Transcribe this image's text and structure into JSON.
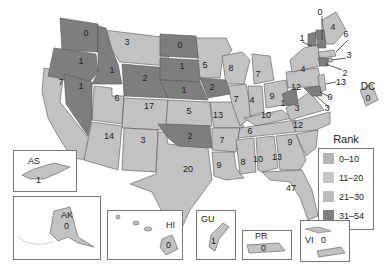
{
  "title": "",
  "legend": {
    "title": "Rank",
    "items": [
      {
        "label": "0–10",
        "color": "#b4b4b4"
      },
      {
        "label": "11–20",
        "color": "#c6c6c6"
      },
      {
        "label": "21–30",
        "color": "#bcbcbc"
      },
      {
        "label": "31–54",
        "color": "#808080"
      }
    ]
  },
  "colors": {
    "light": "#c2c2c2",
    "dark": "#7e7e7e",
    "stroke": "#555555"
  },
  "states": {
    "WA": "0",
    "OR": "1",
    "CA": "7",
    "NV": "1",
    "ID": "1",
    "MT": "3",
    "WY": "2",
    "UT": "6",
    "CO": "17",
    "AZ": "14",
    "NM": "3",
    "ND": "0",
    "SD": "1",
    "NE": "1",
    "KS": "5",
    "OK": "2",
    "TX": "20",
    "MN": "5",
    "IA": "2",
    "MO": "13",
    "AR": "7",
    "LA": "9",
    "WI": "8",
    "IL": "7",
    "MI": "7",
    "IN": "4",
    "OH": "9",
    "KY": "10",
    "TN": "6",
    "MS": "8",
    "AL": "10",
    "GA": "13",
    "FL": "47",
    "SC": "9",
    "NC": "12",
    "VA": "3",
    "WV": "1",
    "PA": "12",
    "NY": "4",
    "ME": "4",
    "VT": "1",
    "NH": "0",
    "MA": "6",
    "RI": "3",
    "CT": "2",
    "NJ": "13",
    "DE": "0",
    "MD": "3"
  },
  "territories": {
    "DC": {
      "label": "DC",
      "value": "0"
    },
    "AS": {
      "label": "AS",
      "value": "1"
    },
    "AK": {
      "label": "AK",
      "value": "0"
    },
    "HI": {
      "label": "HI",
      "value": "0"
    },
    "GU": {
      "label": "GU",
      "value": "1"
    },
    "PR": {
      "label": "PR",
      "value": "0"
    },
    "VI": {
      "label": "VI",
      "value": "0"
    }
  }
}
